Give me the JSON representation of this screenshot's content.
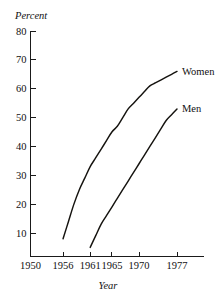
{
  "chart_data": {
    "type": "line",
    "title": "",
    "xlabel": "Year",
    "ylabel": "Percent",
    "xlim": [
      1950,
      1980
    ],
    "ylim": [
      0,
      80
    ],
    "grid": false,
    "legend_position": "inline-right-of-line-end",
    "x_ticks": [
      1950,
      1956,
      1961,
      1965,
      1970,
      1977
    ],
    "x_tick_labels": [
      "1950",
      "1956",
      "1961",
      "1965",
      "1970",
      "1977"
    ],
    "y_ticks": [
      10,
      20,
      30,
      40,
      50,
      60,
      70,
      80
    ],
    "y_tick_labels": [
      "10",
      "20",
      "30",
      "40",
      "50",
      "60",
      "70",
      "80"
    ],
    "series": [
      {
        "name": "Women",
        "label": "Women",
        "color": "#15130f",
        "x": [
          1956,
          1957,
          1958,
          1959,
          1960,
          1961,
          1962,
          1963,
          1964,
          1965,
          1966,
          1967,
          1968,
          1969,
          1970,
          1971,
          1972,
          1973,
          1974,
          1975,
          1976,
          1977
        ],
        "values": [
          8,
          14,
          20,
          25,
          29,
          33,
          36,
          39,
          42,
          45,
          47,
          50,
          53,
          55,
          57,
          59,
          61,
          62,
          63,
          64,
          65,
          66
        ]
      },
      {
        "name": "Men",
        "label": "Men",
        "color": "#15130f",
        "x": [
          1961,
          1962,
          1963,
          1964,
          1965,
          1966,
          1967,
          1968,
          1969,
          1970,
          1971,
          1972,
          1973,
          1974,
          1975,
          1976,
          1977
        ],
        "values": [
          5,
          9,
          13,
          16,
          19,
          22,
          25,
          28,
          31,
          34,
          37,
          40,
          43,
          46,
          49,
          51,
          53
        ]
      }
    ]
  },
  "axes": {
    "y_axis_title": "Percent",
    "x_axis_title": "Year"
  }
}
